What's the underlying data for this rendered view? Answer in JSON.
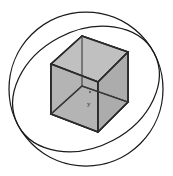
{
  "figure": {
    "caption": "",
    "width": 173,
    "height": 176,
    "background_color": "#ffffff"
  },
  "colors": {
    "stroke": "#1a1a1a",
    "cube_edge": "#2b2b2b",
    "cube_fill_top": "#b9b9b9",
    "cube_fill_left": "#b2b2b2",
    "cube_fill_right": "#ababab",
    "center_marker": "#555555"
  },
  "sphere": {
    "name": "sphere-outline",
    "center_x": 86,
    "center_y": 89,
    "radius": 77,
    "stroke_width": 1.25
  },
  "great_circle": {
    "name": "sphere-great-circle",
    "center_x": 86,
    "center_y": 89,
    "radius_x": 77,
    "radius_y": 58,
    "rotation_deg": -28,
    "stroke_width": 1.25
  },
  "cube": {
    "name": "inscribed-cube",
    "vertices": {
      "top_back": [
        82,
        36
      ],
      "top_left": [
        51,
        64
      ],
      "top_right": [
        128,
        52
      ],
      "top_front": [
        98,
        82
      ],
      "bottom_back": [
        82,
        86
      ],
      "bottom_left": [
        51,
        114
      ],
      "bottom_right": [
        128,
        102
      ],
      "bottom_front": [
        98,
        132
      ]
    },
    "edge_count": 12,
    "face_count": 6
  },
  "center_marker": {
    "name": "sphere-center-point",
    "x": 90,
    "y": 92,
    "radius": 1.1,
    "label": "y",
    "label_x": 89,
    "label_y": 103
  },
  "annotations": []
}
